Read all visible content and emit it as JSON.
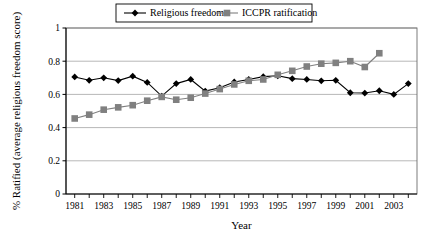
{
  "chart_data": {
    "type": "line",
    "title": "",
    "xlabel": "Year",
    "ylabel": "% Ratified (average religious freedom score)",
    "xlim": [
      1980.4,
      2004.6
    ],
    "ylim": [
      0,
      1
    ],
    "ytick_values": [
      0,
      0.2,
      0.4,
      0.6,
      0.8,
      1
    ],
    "ytick_labels": [
      "0",
      "0.2",
      "0.4",
      "0.6",
      "0.8",
      "1"
    ],
    "xtick_values": [
      1981,
      1982,
      1983,
      1984,
      1985,
      1986,
      1987,
      1988,
      1989,
      1990,
      1991,
      1992,
      1993,
      1994,
      1995,
      1996,
      1997,
      1998,
      1999,
      2000,
      2001,
      2002,
      2003,
      2004
    ],
    "xtick_labels": [
      "1981",
      "",
      "1983",
      "",
      "1985",
      "",
      "1987",
      "",
      "1989",
      "",
      "1991",
      "",
      "1993",
      "",
      "1995",
      "",
      "1997",
      "",
      "1999",
      "",
      "2001",
      "",
      "2003",
      ""
    ],
    "grid": "horizontal",
    "legend_position": "top-center",
    "series": [
      {
        "name": "Religious freedom",
        "marker": "diamond",
        "color": "#000000",
        "x": [
          1981,
          1982,
          1983,
          1984,
          1985,
          1986,
          1987,
          1988,
          1989,
          1990,
          1991,
          1992,
          1993,
          1994,
          1995,
          1996,
          1997,
          1998,
          1999,
          2000,
          2001,
          2002,
          2003,
          2004
        ],
        "values": [
          0.705,
          0.685,
          0.7,
          0.683,
          0.71,
          0.672,
          0.59,
          0.665,
          0.69,
          0.62,
          0.64,
          0.675,
          0.69,
          0.707,
          0.712,
          0.695,
          0.69,
          0.682,
          0.685,
          0.61,
          0.608,
          0.622,
          0.6,
          0.665
        ]
      },
      {
        "name": "ICCPR ratification",
        "marker": "square",
        "color": "#808080",
        "x": [
          1981,
          1982,
          1983,
          1984,
          1985,
          1986,
          1987,
          1988,
          1989,
          1990,
          1991,
          1992,
          1993,
          1994,
          1995,
          1996,
          1997,
          1998,
          1999,
          2000,
          2001,
          2002
        ],
        "values": [
          0.455,
          0.478,
          0.508,
          0.522,
          0.535,
          0.562,
          0.585,
          0.568,
          0.58,
          0.605,
          0.632,
          0.66,
          0.682,
          0.69,
          0.718,
          0.742,
          0.768,
          0.785,
          0.79,
          0.8,
          0.765,
          0.848
        ]
      }
    ]
  }
}
